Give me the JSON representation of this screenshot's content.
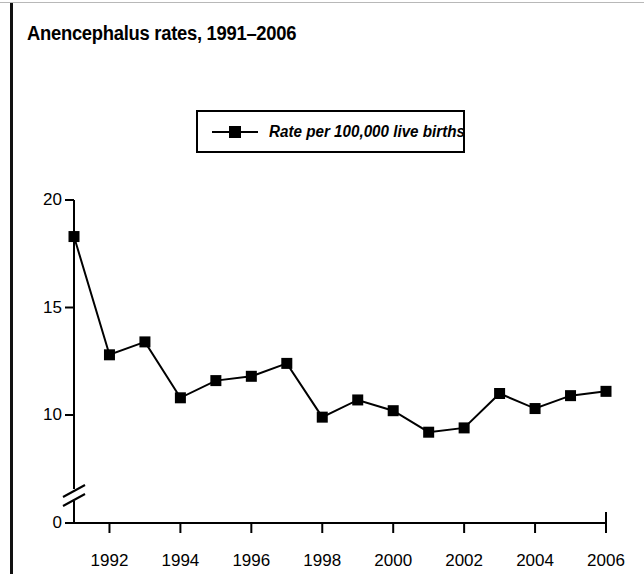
{
  "figure": {
    "title": "Anencephalus rates, 1991–2006",
    "border_color": "#111111",
    "background": "#ffffff"
  },
  "legend": {
    "position": "top-center",
    "marker": "filled-square-with-line",
    "entries": [
      {
        "label": "Rate per 100,000 live births",
        "color": "#000000"
      }
    ]
  },
  "chart_data": {
    "type": "line",
    "title": "Anencephalus rates, 1991–2006",
    "xlabel": "",
    "ylabel": "",
    "series": [
      {
        "name": "Rate per 100,000 live births",
        "color": "#000000",
        "marker": "square",
        "values": [
          18.3,
          12.8,
          13.4,
          10.8,
          11.6,
          11.8,
          12.4,
          9.9,
          10.7,
          10.2,
          9.2,
          9.4,
          11.0,
          10.3,
          10.9,
          11.1
        ]
      }
    ],
    "x": [
      1991,
      1992,
      1993,
      1994,
      1995,
      1996,
      1997,
      1998,
      1999,
      2000,
      2001,
      2002,
      2003,
      2004,
      2005,
      2006
    ],
    "xlim": [
      1991,
      2006
    ],
    "ylim": [
      0,
      20
    ],
    "yticks": [
      0,
      10,
      15,
      20
    ],
    "ytick_labels": [
      "0",
      "10",
      "15",
      "20"
    ],
    "xticks": [
      1992,
      1994,
      1996,
      1998,
      2000,
      2002,
      2004,
      2006
    ],
    "xtick_labels": [
      "1992",
      "1994",
      "1996",
      "1998",
      "2000",
      "2002",
      "2004",
      "2006"
    ],
    "axis_break": {
      "axis": "y",
      "between": [
        0,
        10
      ],
      "style": "double-slash"
    },
    "grid": false,
    "legend_position": "top-center"
  }
}
